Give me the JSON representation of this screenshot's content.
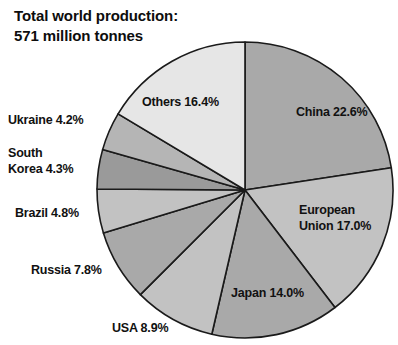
{
  "chart_data": {
    "type": "pie",
    "title": "Total world production:\n571 million tonnes",
    "title_line1": "Total world production:",
    "title_line2": "571 million tonnes",
    "total_label": "571 million tonnes",
    "total_value": 571,
    "total_units": "million tonnes",
    "xlabel": "",
    "ylabel": "",
    "legend_position": "labels-on-and-around-slices",
    "grid": false,
    "start_angle_deg": 0,
    "direction": "clockwise",
    "categories": [
      "China",
      "European Union",
      "Japan",
      "USA",
      "Russia",
      "Brazil",
      "South Korea",
      "Ukraine",
      "Others"
    ],
    "values": [
      22.6,
      17.0,
      14.0,
      8.9,
      7.8,
      4.8,
      4.3,
      4.2,
      16.4
    ],
    "value_suffix": "%",
    "slices": [
      {
        "name": "China",
        "label": "China 22.6%",
        "label_line1": "China 22.6%",
        "label_line2": "",
        "value": 22.6,
        "color": "#a9a9a9",
        "placement": "inside",
        "x": 296,
        "y": 104
      },
      {
        "name": "European Union",
        "label": "European\nUnion 17.0%",
        "label_line1": "European",
        "label_line2": "Union 17.0%",
        "value": 17.0,
        "color": "#c2c2c2",
        "placement": "inside",
        "x": 299,
        "y": 202
      },
      {
        "name": "Japan",
        "label": "Japan 14.0%",
        "label_line1": "Japan 14.0%",
        "label_line2": "",
        "value": 14.0,
        "color": "#a9a9a9",
        "placement": "inside",
        "x": 231,
        "y": 285
      },
      {
        "name": "USA",
        "label": "USA 8.9%",
        "label_line1": "USA 8.9%",
        "label_line2": "",
        "value": 8.9,
        "color": "#c2c2c2",
        "placement": "outside",
        "x": 112,
        "y": 320
      },
      {
        "name": "Russia",
        "label": "Russia 7.8%",
        "label_line1": "Russia 7.8%",
        "label_line2": "",
        "value": 7.8,
        "color": "#a9a9a9",
        "placement": "outside",
        "x": 31,
        "y": 262
      },
      {
        "name": "Brazil",
        "label": "Brazil 4.8%",
        "label_line1": "Brazil 4.8%",
        "label_line2": "",
        "value": 4.8,
        "color": "#c2c2c2",
        "placement": "outside",
        "x": 15,
        "y": 205
      },
      {
        "name": "South Korea",
        "label": "South\nKorea 4.3%",
        "label_line1": "South",
        "label_line2": "Korea 4.3%",
        "value": 4.3,
        "color": "#9a9a9a",
        "placement": "outside",
        "x": 8,
        "y": 145
      },
      {
        "name": "Ukraine",
        "label": "Ukraine 4.2%",
        "label_line1": "Ukraine 4.2%",
        "label_line2": "",
        "value": 4.2,
        "color": "#b5b5b5",
        "placement": "outside",
        "x": 8,
        "y": 112
      },
      {
        "name": "Others",
        "label": "Others 16.4%",
        "label_line1": "Others 16.4%",
        "label_line2": "",
        "value": 16.4,
        "color": "#e6e6e6",
        "placement": "inside",
        "x": 142,
        "y": 94
      }
    ],
    "geometry": {
      "center_x": 245,
      "center_y": 190,
      "radius": 148
    },
    "stroke_color": "#1a1a1a",
    "background_color": "#ffffff"
  }
}
